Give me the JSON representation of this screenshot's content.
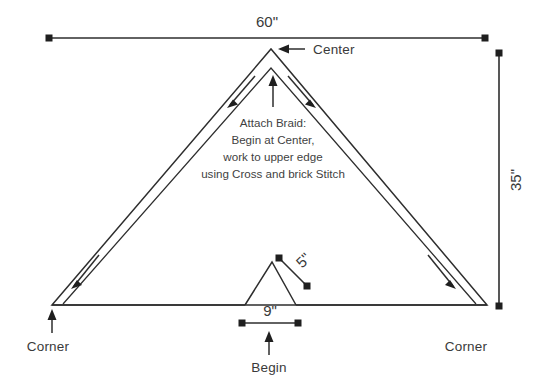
{
  "diagram": {
    "background_color": "#ffffff",
    "line_color": "#2e2e2e",
    "text_color": "#3a3a3a",
    "dimensions": {
      "width_label": "60\"",
      "height_label": "35\"",
      "notch_side_label": "5\"",
      "notch_base_label": "9\""
    },
    "labels": {
      "center": "Center",
      "corner_left": "Corner",
      "corner_right": "Corner",
      "begin": "Begin"
    },
    "note": {
      "line1": "Attach Braid:",
      "line2": "Begin at Center,",
      "line3": "work to upper edge",
      "line4": "using Cross and brick Stitch"
    }
  }
}
